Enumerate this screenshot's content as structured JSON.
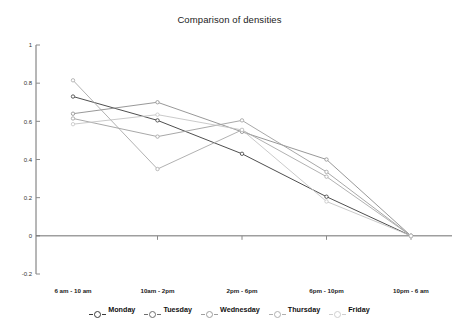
{
  "chart_data": {
    "type": "line",
    "title": "Comparison of densities",
    "xlabel": "",
    "ylabel": "",
    "categories": [
      "6 am - 10 am",
      "10am - 2pm",
      "2pm - 6pm",
      "6pm - 10pm",
      "10pm - 6 am"
    ],
    "ylim": [
      -0.2,
      1
    ],
    "yticks": [
      1,
      0.8,
      0.6,
      0.4,
      0.2,
      0,
      -0.2
    ],
    "ytick_labels": [
      "1",
      "0.8",
      "0.6",
      "0.4",
      "0.2",
      "0",
      "-0.2"
    ],
    "grid": false,
    "legend_position": "bottom",
    "marker": "circle-open",
    "series": [
      {
        "name": "Monday",
        "color": "#3a3a3a",
        "values": [
          0.73,
          0.605,
          0.43,
          0.205,
          0.0
        ]
      },
      {
        "name": "Tuesday",
        "color": "#8c8c8c",
        "values": [
          0.64,
          0.7,
          0.545,
          0.4,
          0.0
        ]
      },
      {
        "name": "Wednesday",
        "color": "#9e9e9e",
        "values": [
          0.615,
          0.52,
          0.605,
          0.335,
          0.0
        ]
      },
      {
        "name": "Thursday",
        "color": "#a8a8a8",
        "values": [
          0.815,
          0.35,
          0.555,
          0.31,
          0.0
        ]
      },
      {
        "name": "Friday",
        "color": "#c4c4c4",
        "values": [
          0.585,
          0.635,
          0.555,
          0.18,
          0.0
        ]
      }
    ]
  },
  "axis": {
    "axis_color": "#6f6f6f",
    "tick_color": "#8a8a8a"
  },
  "legend": {
    "items": [
      {
        "label": "Monday",
        "marker_color": "#3a3a3a"
      },
      {
        "label": "Tuesday",
        "marker_color": "#6e6e6e"
      },
      {
        "label": "Wednesday",
        "marker_color": "#9e9e9e"
      },
      {
        "label": "Thursday",
        "marker_color": "#b0b0b0"
      },
      {
        "label": "Friday",
        "marker_color": "#cfcfcf"
      }
    ]
  }
}
